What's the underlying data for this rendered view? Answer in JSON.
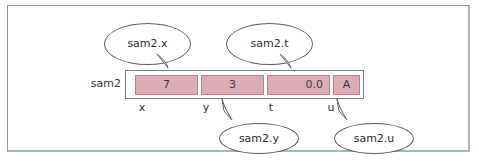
{
  "figure": {
    "struct_variable": "sam2",
    "record": {
      "fields": [
        {
          "name": "x",
          "value": "7",
          "align": "center",
          "callout": "sam2.x"
        },
        {
          "name": "y",
          "value": "3",
          "align": "center",
          "callout": "sam2.y"
        },
        {
          "name": "t",
          "value": "0.0",
          "align": "right",
          "callout": "sam2.t"
        },
        {
          "name": "u",
          "value": "A",
          "align": "center",
          "callout": "sam2.u"
        }
      ]
    },
    "callouts": {
      "top_left": "sam2.x",
      "top_right": "sam2.t",
      "bottom_left": "sam2.y",
      "bottom_right": "sam2.u"
    },
    "colors": {
      "cell_fill": "#ddacb7",
      "cell_border": "#b9808f",
      "box_border": "#7b7f80",
      "bubble_stroke": "#5d5d5d",
      "page_border": "#8d9496",
      "page_border_bottom": "#9fbcbd",
      "background": "#ffffff",
      "text": "#2f2f2f"
    }
  }
}
